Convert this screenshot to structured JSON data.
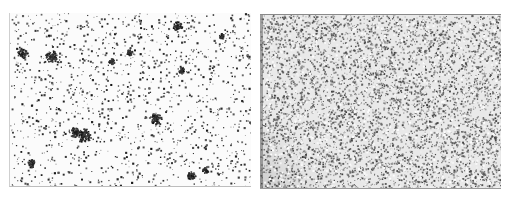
{
  "figure": {
    "panels": [
      {
        "id": "left",
        "description": "sparse dark stained particles with scattered large clusters on white background",
        "background": "#fbfbfb",
        "particle_color": "#2a2a2a",
        "density": "sparse"
      },
      {
        "id": "right",
        "description": "dense fine grey stained particles on light grey background with paler diagonal streak at bottom-left",
        "background": "#e9e9e9",
        "particle_color": "#5a5a5a",
        "density": "dense"
      }
    ]
  }
}
